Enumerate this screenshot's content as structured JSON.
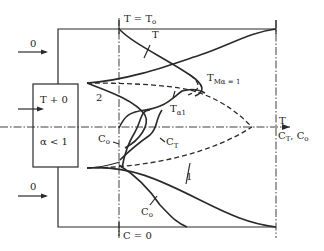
{
  "diagram": {
    "labels": {
      "top_axis": "T = T",
      "top_axis_sub": "o",
      "bottom_axis": "C = 0",
      "curve_T": "T",
      "curve_TM": "T",
      "curve_TM_sub": "Mα = 1",
      "curve_Ta1": "T",
      "curve_Ta1_sub": "α1",
      "curve_CT": "C",
      "curve_CT_sub": "T",
      "curve_Co_upper": "C",
      "curve_Co_upper_sub": "o",
      "curve_Co_lower": "C",
      "curve_Co_lower_sub": "o",
      "label_2": "2",
      "label_1": "1",
      "box_top": "T + 0",
      "box_bottom": "α < 1",
      "inlet_top": "0",
      "inlet_bottom": "0",
      "axis_right_T": "T",
      "axis_right_C": "C",
      "axis_right_C_sub1": "T",
      "axis_right_sep": ", C",
      "axis_right_C_sub2": "o"
    }
  }
}
